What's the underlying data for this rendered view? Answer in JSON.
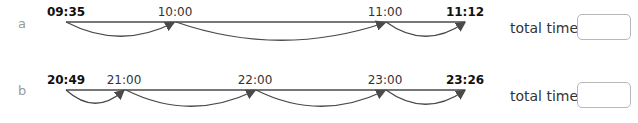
{
  "rows": [
    {
      "letter": "a",
      "start": "09:35",
      "points": [
        "10:00",
        "11:00"
      ],
      "end": "11:12",
      "total_label": "total time:",
      "total_value": ""
    },
    {
      "letter": "b",
      "start": "20:49",
      "points": [
        "21:00",
        "22:00",
        "23:00"
      ],
      "end": "23:26",
      "total_label": "total time:",
      "total_value": ""
    }
  ],
  "colors": {
    "line": "#4a4a4a",
    "letter": "#9a9a9a",
    "box_border": "#b8b8b8"
  }
}
